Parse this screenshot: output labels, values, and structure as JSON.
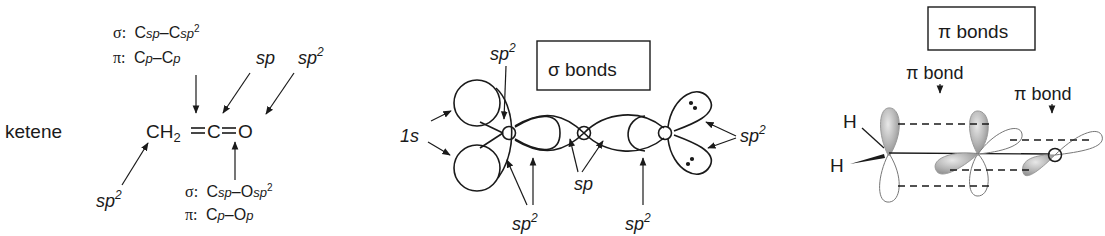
{
  "panel_ketene": {
    "name_label": "ketene",
    "formula": {
      "ch": "CH",
      "sub2": "2",
      "c": "C",
      "o": "O"
    },
    "top_bond_label": {
      "sigma_prefix": "σ:",
      "sigma_a": "C",
      "sigma_a_sub": "sp",
      "sigma_dash": "–",
      "sigma_b": "C",
      "sigma_b_sub": "sp",
      "sigma_b_sup": "2",
      "pi_prefix": "π:",
      "pi_a": "C",
      "pi_a_sub": "p",
      "pi_dash": "–",
      "pi_b": "C",
      "pi_b_sub": "p"
    },
    "bottom_bond_label": {
      "sigma_prefix": "σ:",
      "sigma_a": "C",
      "sigma_a_sub": "sp",
      "sigma_dash": "–",
      "sigma_b": "O",
      "sigma_b_sub": "sp",
      "sigma_b_sup": "2",
      "pi_prefix": "π:",
      "pi_a": "C",
      "pi_a_sub": "p",
      "pi_dash": "–",
      "pi_b": "O",
      "pi_b_sub": "p"
    },
    "hybrid_labels": {
      "central_c": {
        "base": "sp",
        "sup": ""
      },
      "oxygen": {
        "base": "sp",
        "sup": "2"
      },
      "ch2_carbon": {
        "base": "sp",
        "sup": "2"
      }
    }
  },
  "panel_sigma": {
    "title": "σ bonds",
    "labels": {
      "h_orbital": "1s",
      "top_sp2": {
        "base": "sp",
        "sup": "2"
      },
      "bottom_left_sp2": {
        "base": "sp",
        "sup": "2"
      },
      "sp": "sp",
      "bottom_right_sp2": {
        "base": "sp",
        "sup": "2"
      },
      "oxygen_lone_pair_sp2": {
        "base": "sp",
        "sup": "2"
      }
    },
    "atoms": {
      "c1": "C",
      "c2": "C",
      "o": "O"
    }
  },
  "panel_pi": {
    "title": "π bonds",
    "bond_label_1": "π bond",
    "bond_label_2": "π bond",
    "atoms": {
      "h_top": "H",
      "h_bottom": "H",
      "c_end": "C"
    },
    "orbital_fill": "#b8b8b8",
    "orbital_fill_light": "#e4e4e4"
  }
}
